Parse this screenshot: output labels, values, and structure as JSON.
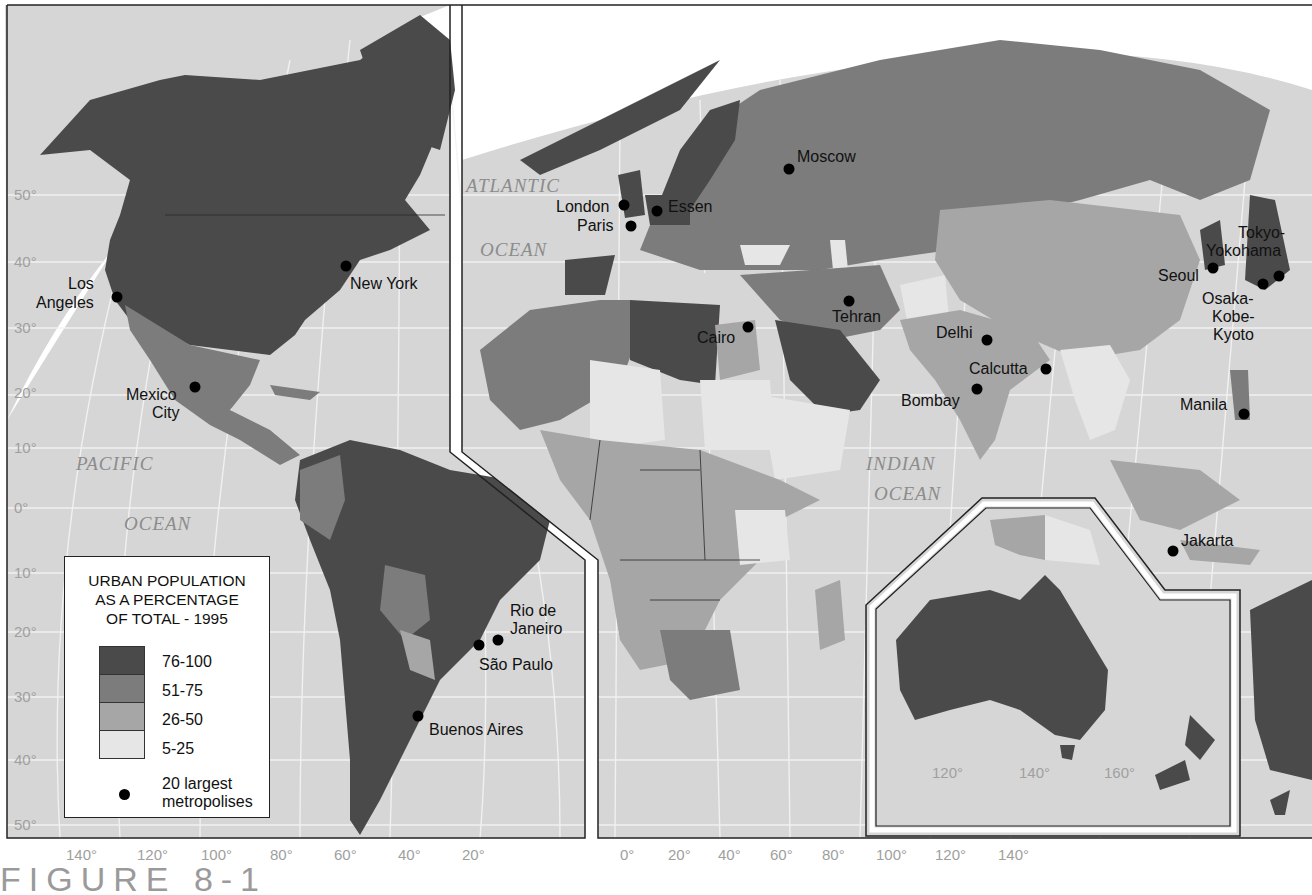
{
  "figure": {
    "caption": "FIGURE 8-1"
  },
  "legend": {
    "title_lines": [
      "URBAN POPULATION",
      "AS A PERCENTAGE",
      "OF TOTAL - 1995"
    ],
    "categories": [
      {
        "label": "76-100",
        "color": "#4a4a4a"
      },
      {
        "label": "51-75",
        "color": "#7c7c7c"
      },
      {
        "label": "26-50",
        "color": "#a6a6a6"
      },
      {
        "label": "5-25",
        "color": "#e6e6e6"
      }
    ],
    "dot_label_lines": [
      "20 largest",
      "metropolises"
    ]
  },
  "oceans": [
    {
      "name": "atlantic-line1",
      "text": "ATLANTIC"
    },
    {
      "name": "atlantic-line2",
      "text": "OCEAN"
    },
    {
      "name": "pacific-line1",
      "text": "PACIFIC"
    },
    {
      "name": "pacific-line2",
      "text": "OCEAN"
    },
    {
      "name": "indian-line1",
      "text": "INDIAN"
    },
    {
      "name": "indian-line2",
      "text": "OCEAN"
    }
  ],
  "latitude_ticks_left": [
    "50°",
    "40°",
    "30°",
    "20°",
    "10°",
    "0°",
    "10°",
    "20°",
    "30°",
    "40°",
    "50°"
  ],
  "longitude_ticks_left": [
    "140°",
    "120°",
    "100°",
    "80°",
    "60°",
    "40°",
    "20°"
  ],
  "longitude_ticks_right": [
    "0°",
    "20°",
    "40°",
    "60°",
    "80°",
    "100°",
    "120°",
    "140°"
  ],
  "inset_longitude_ticks": [
    "120°",
    "140°",
    "160°"
  ],
  "cities": [
    {
      "name": "Los Angeles",
      "lines": [
        "Los",
        "Angeles"
      ]
    },
    {
      "name": "Mexico City",
      "lines": [
        "Mexico",
        "City"
      ]
    },
    {
      "name": "New York",
      "lines": [
        "New York"
      ]
    },
    {
      "name": "Rio de Janeiro",
      "lines": [
        "Rio de",
        "Janeiro"
      ]
    },
    {
      "name": "São Paulo",
      "lines": [
        "São Paulo"
      ]
    },
    {
      "name": "Buenos Aires",
      "lines": [
        "Buenos Aires"
      ]
    },
    {
      "name": "London",
      "lines": [
        "London"
      ]
    },
    {
      "name": "Paris",
      "lines": [
        "Paris"
      ]
    },
    {
      "name": "Essen",
      "lines": [
        "Essen"
      ]
    },
    {
      "name": "Moscow",
      "lines": [
        "Moscow"
      ]
    },
    {
      "name": "Cairo",
      "lines": [
        "Cairo"
      ]
    },
    {
      "name": "Tehran",
      "lines": [
        "Tehran"
      ]
    },
    {
      "name": "Delhi",
      "lines": [
        "Delhi"
      ]
    },
    {
      "name": "Calcutta",
      "lines": [
        "Calcutta"
      ]
    },
    {
      "name": "Bombay",
      "lines": [
        "Bombay"
      ]
    },
    {
      "name": "Seoul",
      "lines": [
        "Seoul"
      ]
    },
    {
      "name": "Tokyo-Yokohama",
      "lines": [
        "Tokyo-",
        "Yokohama"
      ]
    },
    {
      "name": "Osaka-Kobe-Kyoto",
      "lines": [
        "Osaka-",
        "Kobe-",
        "Kyoto"
      ]
    },
    {
      "name": "Manila",
      "lines": [
        "Manila"
      ]
    },
    {
      "name": "Jakarta",
      "lines": [
        "Jakarta"
      ]
    }
  ]
}
